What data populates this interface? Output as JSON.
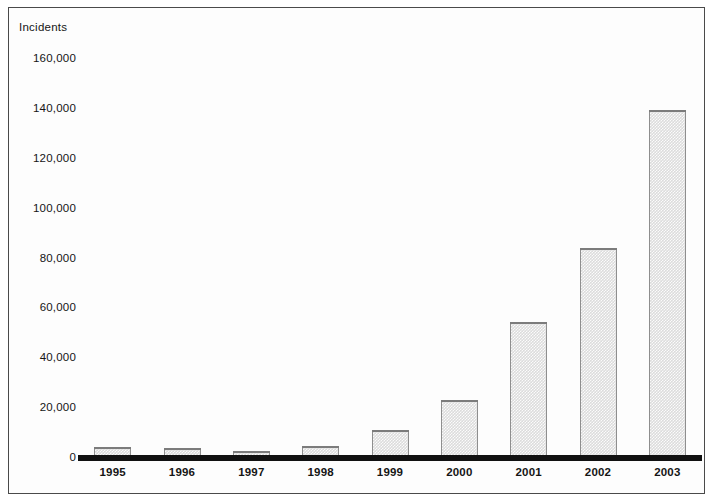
{
  "chart_data": {
    "type": "bar",
    "title": "",
    "subtitle": "",
    "ylabel": "Incidents",
    "xlabel": "",
    "categories": [
      "1995",
      "1996",
      "1997",
      "1998",
      "1999",
      "2000",
      "2001",
      "2002",
      "2003"
    ],
    "values": [
      4000,
      3800,
      2600,
      4500,
      11000,
      23000,
      54000,
      84000,
      139000
    ],
    "ylim": [
      0,
      160000
    ],
    "yticks": [
      0,
      20000,
      40000,
      60000,
      80000,
      100000,
      120000,
      140000,
      160000
    ],
    "ytick_labels": [
      "0",
      "20,000",
      "40,000",
      "60,000",
      "80,000",
      "100,000",
      "120,000",
      "140,000",
      "160,000"
    ],
    "grid": false,
    "legend": null,
    "legend_position": "none",
    "series": [
      {
        "name": "Incidents",
        "values": [
          4000,
          3800,
          2600,
          4500,
          11000,
          23000,
          54000,
          84000,
          139000
        ]
      }
    ],
    "bar_fill_color": "#dcdcdc",
    "bar_outline_color": "#8e8e8e",
    "axis_color": "#111111",
    "frame_color": "#4a4a4a",
    "text_color": "#151515"
  }
}
